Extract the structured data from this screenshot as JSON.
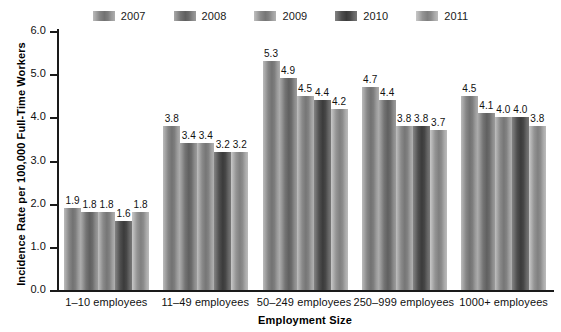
{
  "chart_data": {
    "type": "bar",
    "title": "",
    "xlabel": "Employment Size",
    "ylabel": "Incidence Rate per 100,000 Full-Time Workers",
    "ylim": [
      0.0,
      6.0
    ],
    "ytick_labels": [
      "0.0",
      "1.0",
      "2.0",
      "3.0",
      "4.0",
      "5.0",
      "6.0"
    ],
    "ytick_values": [
      0.0,
      1.0,
      2.0,
      3.0,
      4.0,
      5.0,
      6.0
    ],
    "grid": false,
    "legend_position": "top-center",
    "categories": [
      "1–10 employees",
      "11–49 employees",
      "50–249 employees",
      "250–999 employees",
      "1000+ employees"
    ],
    "series": [
      {
        "name": "2007",
        "values": [
          1.9,
          3.8,
          5.3,
          4.7,
          4.5
        ],
        "labels": [
          "1.9",
          "3.8",
          "5.3",
          "4.7",
          "4.5"
        ],
        "color": "#8c8c8c"
      },
      {
        "name": "2008",
        "values": [
          1.8,
          3.4,
          4.9,
          4.4,
          4.1
        ],
        "labels": [
          "1.8",
          "3.4",
          "4.9",
          "4.4",
          "4.1"
        ],
        "color": "#7a7a7a"
      },
      {
        "name": "2009",
        "values": [
          1.8,
          3.4,
          4.5,
          3.8,
          4.0
        ],
        "labels": [
          "1.8",
          "3.4",
          "4.5",
          "3.8",
          "4.0"
        ],
        "color": "#909090"
      },
      {
        "name": "2010",
        "values": [
          1.6,
          3.2,
          4.4,
          3.8,
          4.0
        ],
        "labels": [
          "1.6",
          "3.2",
          "4.4",
          "3.8",
          "4.0"
        ],
        "color": "#555555"
      },
      {
        "name": "2011",
        "values": [
          1.8,
          3.2,
          4.2,
          3.7,
          3.8
        ],
        "labels": [
          "1.8",
          "3.2",
          "4.2",
          "3.7",
          "3.8"
        ],
        "color": "#9a9a9a"
      }
    ]
  }
}
